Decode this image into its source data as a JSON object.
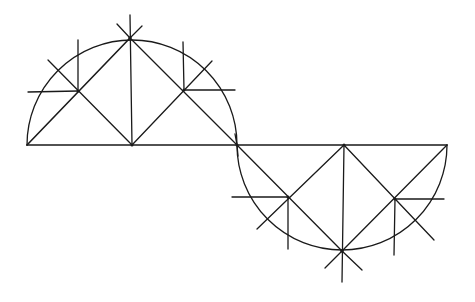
{
  "diagram": {
    "title": "",
    "stroke_color": "#1a1a1a",
    "background": "#ffffff",
    "baseline": {
      "y": 145,
      "x1": 27,
      "x2": 447
    },
    "upper_semicircle": {
      "cx": 132,
      "cy": 145,
      "r": 105,
      "apex": [
        130,
        38
      ]
    },
    "lower_semicircle": {
      "cx": 342,
      "cy": 145,
      "r": 105,
      "apex": [
        342,
        251
      ]
    },
    "upper_points": {
      "left": [
        78,
        91
      ],
      "center_base": [
        132,
        145
      ],
      "right": [
        184,
        90
      ],
      "left_end": [
        27,
        145
      ],
      "right_end": [
        237,
        145
      ]
    },
    "lower_points": {
      "left": [
        288,
        197
      ],
      "center_base": [
        342,
        145
      ],
      "right": [
        395,
        199
      ],
      "right_end": [
        447,
        145
      ]
    },
    "labels": []
  }
}
